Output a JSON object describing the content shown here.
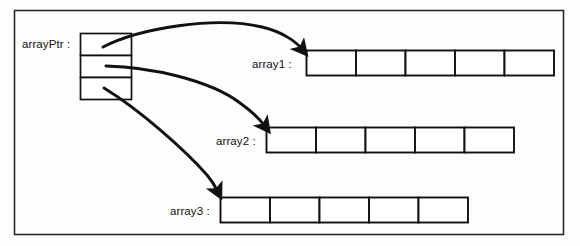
{
  "diagram": {
    "type": "pointer-array-diagram",
    "colors": {
      "stroke": "#111111",
      "fill": "#ffffff",
      "background": "#fdfdfd",
      "border": "#2b2b2b"
    },
    "frame": {
      "x": 14,
      "y": 10,
      "width": 550,
      "height": 225
    },
    "pointer_block": {
      "label": "arrayPtr :",
      "x": 80,
      "y": 33,
      "width": 52,
      "cell_height": 22,
      "cells": 3,
      "cell_values": [
        "",
        "",
        ""
      ]
    },
    "arrays": [
      {
        "name": "array1",
        "label": "array1 :",
        "x": 306,
        "y": 50,
        "cell_width": 49.5,
        "height": 26,
        "cells": 5,
        "cell_values": [
          "",
          "",
          "",
          "",
          ""
        ]
      },
      {
        "name": "array2",
        "label": "array2 :",
        "x": 266,
        "y": 127,
        "cell_width": 49.5,
        "height": 26,
        "cells": 5,
        "cell_values": [
          "",
          "",
          "",
          "",
          ""
        ]
      },
      {
        "name": "array3",
        "label": "array3 :",
        "x": 220,
        "y": 197,
        "cell_width": 49.5,
        "height": 26,
        "cells": 5,
        "cell_values": [
          "",
          "",
          "",
          "",
          ""
        ]
      }
    ],
    "arrows": [
      {
        "name": "arrow-to-array1",
        "from": "arrayPtr cell 1",
        "to": "array1",
        "path": "M 103 47 C 140 28, 215 16, 262 27 C 283 32, 296 42, 301 48"
      },
      {
        "name": "arrow-to-array2",
        "from": "arrayPtr cell 2",
        "to": "array2",
        "path": "M 106 66 C 150 67, 210 80, 240 103 C 255 114, 262 122, 264 126"
      },
      {
        "name": "arrow-to-array3",
        "from": "arrayPtr cell 3",
        "to": "array3",
        "path": "M 104 88 C 140 110, 185 150, 207 175 C 213 182, 216 187, 217 191"
      }
    ]
  }
}
